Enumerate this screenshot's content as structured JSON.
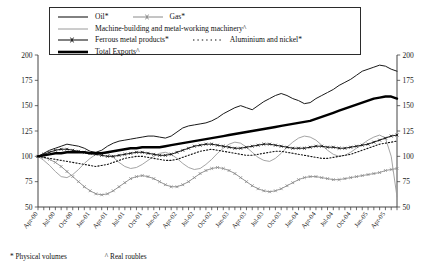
{
  "footnotes": {
    "physical": "* Physical volumes",
    "real": "^ Real roubles"
  },
  "legend": {
    "items": [
      {
        "label": "Oil*",
        "key": "solid-thin-black",
        "color": "#1a1a1a"
      },
      {
        "label": "Gas*",
        "key": "line-with-cross-markers-grey",
        "color": "#8a8a8a"
      },
      {
        "label": "Machine-building and metal-working machinery^",
        "key": "solid-thin-grey",
        "color": "#9a9a9a"
      },
      {
        "label": "Ferrous metal products*",
        "key": "line-with-cross-markers-black",
        "color": "#1a1a1a"
      },
      {
        "label": "Aluminium and nickel*",
        "key": "dotted-black",
        "color": "#111111"
      },
      {
        "label": "Total Exports^",
        "key": "solid-thick-black",
        "color": "#000000"
      }
    ]
  },
  "chart_data": {
    "type": "line",
    "title": "",
    "xlabel": "",
    "ylabel": "",
    "ylim": [
      50,
      200
    ],
    "yticks": [
      50,
      75,
      100,
      125,
      150,
      175,
      200
    ],
    "grid": false,
    "dual_axis": true,
    "legend_position": "top-inside",
    "x_tick_labels": [
      "Apr-00",
      "Jul-00",
      "Oct-00",
      "Jan-01",
      "Apr-01",
      "Jul-01",
      "Oct-01",
      "Jan-02",
      "Apr-02",
      "Jul-02",
      "Oct-02",
      "Jan-03",
      "Apr-03",
      "Jul-03",
      "Oct-03",
      "Jan-04",
      "Apr-04",
      "Jul-04",
      "Oct-04",
      "Jan-05",
      "Apr-05"
    ],
    "x_tick_step_months": 3,
    "x": [
      "Apr-00",
      "May-00",
      "Jun-00",
      "Jul-00",
      "Aug-00",
      "Sep-00",
      "Oct-00",
      "Nov-00",
      "Dec-00",
      "Jan-01",
      "Feb-01",
      "Mar-01",
      "Apr-01",
      "May-01",
      "Jun-01",
      "Jul-01",
      "Aug-01",
      "Sep-01",
      "Oct-01",
      "Nov-01",
      "Dec-01",
      "Jan-02",
      "Feb-02",
      "Mar-02",
      "Apr-02",
      "May-02",
      "Jun-02",
      "Jul-02",
      "Aug-02",
      "Sep-02",
      "Oct-02",
      "Nov-02",
      "Dec-02",
      "Jan-03",
      "Feb-03",
      "Mar-03",
      "Apr-03",
      "May-03",
      "Jun-03",
      "Jul-03",
      "Aug-03",
      "Sep-03",
      "Oct-03",
      "Nov-03",
      "Dec-03",
      "Jan-04",
      "Feb-04",
      "Mar-04",
      "Apr-04",
      "May-04",
      "Jun-04",
      "Jul-04",
      "Aug-04",
      "Sep-04",
      "Oct-04",
      "Nov-04",
      "Dec-04",
      "Jan-05",
      "Feb-05",
      "Mar-05",
      "Apr-05",
      "May-05",
      "Jun-05"
    ],
    "series": [
      {
        "name": "Oil*",
        "style": "solid-thin",
        "color": "#1a1a1a",
        "values": [
          100,
          103,
          106,
          108,
          110,
          112,
          111,
          110,
          108,
          105,
          104,
          106,
          110,
          113,
          115,
          116,
          117,
          118,
          119,
          120,
          120,
          119,
          118,
          120,
          124,
          128,
          130,
          131,
          132,
          133,
          135,
          138,
          142,
          145,
          148,
          150,
          148,
          146,
          150,
          154,
          157,
          160,
          162,
          160,
          157,
          155,
          152,
          153,
          157,
          160,
          163,
          166,
          170,
          173,
          176,
          180,
          184,
          186,
          188,
          190,
          189,
          186,
          184
        ]
      },
      {
        "name": "Gas*",
        "style": "line-markers",
        "color": "#8a8a8a",
        "values": [
          100,
          99,
          97,
          94,
          90,
          85,
          80,
          75,
          70,
          66,
          63,
          62,
          63,
          66,
          70,
          74,
          78,
          80,
          81,
          80,
          78,
          75,
          72,
          70,
          70,
          72,
          75,
          79,
          83,
          86,
          88,
          89,
          88,
          86,
          83,
          79,
          75,
          71,
          68,
          66,
          65,
          66,
          68,
          71,
          74,
          77,
          79,
          80,
          80,
          79,
          78,
          77,
          77,
          78,
          79,
          80,
          81,
          82,
          83,
          84,
          86,
          87,
          88
        ]
      },
      {
        "name": "Machine-building and metal-working machinery^",
        "style": "solid-thin",
        "color": "#9a9a9a",
        "values": [
          100,
          96,
          91,
          85,
          80,
          79,
          82,
          87,
          93,
          98,
          102,
          104,
          103,
          99,
          94,
          90,
          88,
          89,
          92,
          96,
          100,
          103,
          104,
          102,
          98,
          93,
          89,
          87,
          88,
          92,
          97,
          103,
          108,
          112,
          114,
          113,
          109,
          104,
          99,
          96,
          95,
          98,
          103,
          109,
          114,
          118,
          120,
          119,
          116,
          111,
          106,
          102,
          100,
          101,
          104,
          108,
          112,
          116,
          119,
          121,
          118,
          100,
          60
        ]
      },
      {
        "name": "Ferrous metal products*",
        "style": "line-markers",
        "color": "#1a1a1a",
        "values": [
          100,
          102,
          104,
          106,
          107,
          107,
          106,
          105,
          104,
          103,
          102,
          101,
          100,
          100,
          101,
          102,
          103,
          104,
          104,
          103,
          102,
          101,
          101,
          102,
          104,
          106,
          108,
          110,
          111,
          112,
          112,
          111,
          110,
          109,
          108,
          108,
          109,
          110,
          111,
          112,
          112,
          111,
          110,
          109,
          108,
          108,
          108,
          109,
          110,
          110,
          109,
          109,
          108,
          108,
          109,
          110,
          111,
          112,
          114,
          116,
          118,
          120,
          121
        ]
      },
      {
        "name": "Aluminium and nickel*",
        "style": "dotted",
        "color": "#111111",
        "values": [
          100,
          99,
          98,
          97,
          96,
          95,
          94,
          93,
          92,
          91,
          90,
          91,
          92,
          94,
          96,
          98,
          99,
          100,
          100,
          99,
          98,
          97,
          96,
          96,
          97,
          99,
          101,
          103,
          105,
          106,
          107,
          106,
          105,
          104,
          103,
          102,
          101,
          101,
          102,
          103,
          104,
          105,
          105,
          104,
          103,
          102,
          101,
          100,
          99,
          98,
          98,
          99,
          100,
          101,
          102,
          104,
          106,
          108,
          110,
          112,
          113,
          114,
          115
        ]
      },
      {
        "name": "Total Exports^",
        "style": "solid-thick",
        "color": "#000000",
        "values": [
          100,
          101,
          102,
          103,
          103,
          104,
          104,
          104,
          104,
          103,
          103,
          103,
          104,
          105,
          106,
          107,
          108,
          108,
          109,
          109,
          109,
          109,
          110,
          111,
          112,
          113,
          114,
          115,
          116,
          117,
          118,
          119,
          120,
          121,
          122,
          123,
          124,
          125,
          126,
          127,
          128,
          129,
          130,
          131,
          132,
          133,
          134,
          135,
          137,
          139,
          141,
          143,
          145,
          147,
          149,
          151,
          153,
          155,
          157,
          158,
          159,
          159,
          157
        ]
      }
    ]
  }
}
